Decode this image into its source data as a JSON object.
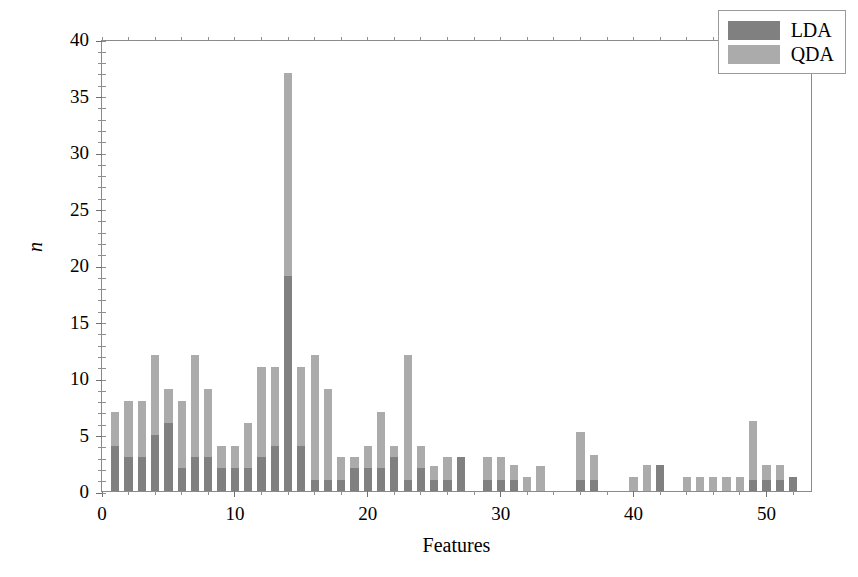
{
  "chart_data": {
    "type": "bar",
    "subtype": "stacked-vertical",
    "title": "",
    "xlabel": "Features",
    "ylabel": "n",
    "xlim": [
      0,
      53.5
    ],
    "ylim": [
      0,
      40
    ],
    "grid": false,
    "legend_position": "top-right",
    "colors": {
      "LDA": "#808080",
      "QDA": "#ababab",
      "axis": "#6f6f6f",
      "background": "#ffffff"
    },
    "xticks": [
      0,
      10,
      20,
      30,
      40,
      50
    ],
    "xtick_labels": [
      "0",
      "10",
      "20",
      "30",
      "40",
      "50"
    ],
    "xticks_minor_step": 2,
    "yticks": [
      0,
      5,
      10,
      15,
      20,
      25,
      30,
      35,
      40
    ],
    "ytick_labels": [
      "0",
      "5",
      "10",
      "15",
      "20",
      "25",
      "30",
      "35",
      "40"
    ],
    "yticks_minor_step": 1,
    "x": [
      1,
      2,
      3,
      4,
      5,
      6,
      7,
      8,
      9,
      10,
      11,
      12,
      13,
      14,
      15,
      16,
      17,
      18,
      19,
      20,
      21,
      22,
      23,
      24,
      25,
      26,
      27,
      29,
      30,
      31,
      32,
      33,
      36,
      37,
      40,
      41,
      42,
      44,
      45,
      46,
      47,
      48,
      49,
      50,
      51,
      52
    ],
    "series": [
      {
        "name": "LDA",
        "color": "#808080",
        "values": [
          4,
          3,
          3,
          5,
          6,
          2,
          3,
          3,
          2,
          2,
          2,
          3,
          4,
          19,
          4,
          1,
          1,
          1,
          2,
          2,
          2,
          3,
          1,
          2,
          1,
          1,
          3,
          1,
          1,
          1,
          0,
          0,
          1,
          1,
          0,
          0,
          2.3,
          0,
          0,
          0,
          0,
          0,
          1,
          1,
          1,
          1.2
        ]
      },
      {
        "name": "QDA",
        "color": "#ababab",
        "values": [
          3,
          5,
          5,
          7,
          3,
          6,
          9,
          6,
          2,
          2,
          4,
          8,
          7,
          18,
          7,
          11,
          8,
          2,
          1,
          2,
          5,
          1,
          11,
          2,
          1.2,
          2,
          0,
          2,
          2,
          1.3,
          1.2,
          2.2,
          4.2,
          2.2,
          1.2,
          2.3,
          0,
          1.2,
          1.2,
          1.2,
          1.2,
          1.2,
          5.2,
          1.3,
          1.3,
          0
        ]
      }
    ],
    "totals": [
      7,
      8,
      8,
      12,
      9,
      8,
      12,
      9,
      4,
      4,
      6,
      11,
      11,
      37,
      11,
      12,
      9,
      3,
      3,
      4,
      7,
      4,
      12,
      4,
      2.2,
      3,
      3,
      3,
      3,
      2.3,
      1.2,
      2.2,
      5.2,
      3.2,
      1.2,
      2.3,
      2.3,
      1.2,
      1.2,
      1.2,
      1.2,
      1.2,
      6.2,
      2.3,
      2.3,
      1.2
    ]
  },
  "legend": {
    "items": [
      {
        "label": "LDA",
        "color": "#808080"
      },
      {
        "label": "QDA",
        "color": "#ababab"
      }
    ]
  }
}
